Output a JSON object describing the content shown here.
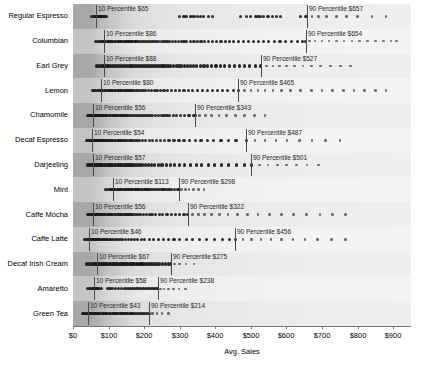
{
  "chart_data": {
    "type": "scatter",
    "title": "",
    "xlabel": "Avg. Sales",
    "ylabel": "",
    "xlim": [
      0,
      950
    ],
    "xticks": [
      0,
      100,
      200,
      300,
      400,
      500,
      600,
      700,
      800,
      900
    ],
    "xtick_labels": [
      "$0",
      "$100",
      "$200",
      "$300",
      "$400",
      "$500",
      "$600",
      "$700",
      "$800",
      "$900"
    ],
    "grid": false,
    "legend": "none",
    "categories": [
      "Regular Espresso",
      "Columbian",
      "Earl Grey",
      "Lemon",
      "Chamomile",
      "Decaf Espresso",
      "Darjeeling",
      "Mint",
      "Caffe Mocha",
      "Caffe Latte",
      "Decaf Irish Cream",
      "Amaretto",
      "Green Tea"
    ],
    "series": [
      {
        "name": "Regular Espresso",
        "p10": 65,
        "p90": 657,
        "p10_label": "10 Percentile $65",
        "p90_label": "90 Percentile $657",
        "points": [
          52,
          58,
          61,
          63,
          64,
          65,
          66,
          67,
          68,
          70,
          71,
          73,
          74,
          76,
          78,
          80,
          83,
          86,
          90,
          94,
          300,
          312,
          318,
          330,
          336,
          342,
          350,
          358,
          366,
          380,
          392,
          470,
          488,
          500,
          512,
          520,
          528,
          536,
          548,
          560,
          572,
          584,
          640,
          655,
          672,
          690,
          712,
          740,
          768,
          800,
          840,
          880
        ]
      },
      {
        "name": "Columbian",
        "p10": 86,
        "p90": 654,
        "p10_label": "10 Percentile $86",
        "p90_label": "90 Percentile $654",
        "points": [
          64,
          70,
          76,
          80,
          84,
          86,
          88,
          92,
          96,
          100,
          104,
          108,
          112,
          116,
          120,
          124,
          128,
          132,
          136,
          140,
          144,
          148,
          152,
          156,
          160,
          164,
          168,
          172,
          176,
          180,
          186,
          192,
          198,
          204,
          210,
          216,
          222,
          228,
          234,
          240,
          248,
          256,
          264,
          272,
          280,
          288,
          296,
          304,
          312,
          320,
          330,
          340,
          350,
          360,
          370,
          380,
          392,
          404,
          416,
          428,
          440,
          452,
          466,
          480,
          494,
          508,
          522,
          536,
          550,
          566,
          582,
          598,
          614,
          630,
          646,
          654,
          664,
          680,
          700,
          720,
          740,
          762,
          784,
          806,
          828,
          850,
          872,
          894,
          910
        ]
      },
      {
        "name": "Earl Grey",
        "p10": 88,
        "p90": 527,
        "p10_label": "10 Percentile $88",
        "p90_label": "90 Percentile $527",
        "points": [
          66,
          72,
          78,
          82,
          86,
          88,
          92,
          96,
          100,
          106,
          112,
          118,
          124,
          130,
          136,
          142,
          148,
          154,
          160,
          166,
          172,
          178,
          184,
          190,
          196,
          202,
          208,
          214,
          220,
          226,
          232,
          238,
          244,
          250,
          256,
          262,
          268,
          274,
          282,
          290,
          298,
          306,
          314,
          322,
          330,
          338,
          348,
          358,
          368,
          378,
          390,
          402,
          414,
          426,
          440,
          454,
          468,
          482,
          496,
          512,
          527,
          544,
          562,
          580,
          600,
          622,
          646,
          670,
          696,
          724,
          752,
          780
        ]
      },
      {
        "name": "Lemon",
        "p10": 80,
        "p90": 465,
        "p10_label": "10 Percentile $80",
        "p90_label": "90 Percentile $465",
        "points": [
          56,
          62,
          68,
          72,
          76,
          80,
          84,
          88,
          92,
          96,
          100,
          104,
          108,
          112,
          116,
          120,
          124,
          128,
          132,
          136,
          140,
          144,
          148,
          152,
          156,
          160,
          164,
          168,
          174,
          180,
          186,
          192,
          198,
          204,
          212,
          220,
          228,
          236,
          246,
          256,
          266,
          276,
          288,
          300,
          312,
          324,
          336,
          350,
          364,
          378,
          392,
          406,
          420,
          434,
          450,
          465,
          482,
          500,
          520,
          540,
          562,
          586,
          612,
          640,
          670,
          700,
          730,
          760,
          790,
          820,
          850,
          880
        ]
      },
      {
        "name": "Chamomile",
        "p10": 56,
        "p90": 343,
        "p10_label": "10 Percentile $56",
        "p90_label": "90 Percentile $343",
        "points": [
          40,
          44,
          48,
          52,
          54,
          56,
          58,
          60,
          62,
          64,
          66,
          68,
          70,
          72,
          74,
          76,
          78,
          80,
          82,
          84,
          86,
          88,
          90,
          94,
          98,
          102,
          106,
          110,
          114,
          118,
          122,
          126,
          130,
          134,
          138,
          142,
          146,
          152,
          158,
          164,
          170,
          176,
          182,
          188,
          194,
          200,
          206,
          212,
          218,
          224,
          232,
          240,
          248,
          256,
          264,
          272,
          282,
          292,
          302,
          314,
          326,
          338,
          343,
          356,
          372,
          390,
          410,
          432,
          456,
          482,
          510,
          540
        ]
      },
      {
        "name": "Decaf Espresso",
        "p10": 54,
        "p90": 487,
        "p10_label": "10 Percentile $54",
        "p90_label": "90 Percentile $487",
        "points": [
          38,
          42,
          46,
          50,
          52,
          54,
          56,
          58,
          60,
          62,
          64,
          66,
          68,
          70,
          72,
          74,
          76,
          78,
          80,
          82,
          84,
          86,
          88,
          90,
          92,
          94,
          96,
          100,
          104,
          108,
          112,
          116,
          120,
          124,
          128,
          132,
          136,
          140,
          144,
          148,
          154,
          160,
          166,
          172,
          180,
          188,
          196,
          204,
          214,
          224,
          234,
          246,
          258,
          270,
          284,
          298,
          312,
          328,
          344,
          360,
          378,
          396,
          416,
          436,
          458,
          487,
          512,
          540,
          570,
          602,
          636,
          672,
          710,
          750
        ]
      },
      {
        "name": "Darjeeling",
        "p10": 57,
        "p90": 501,
        "p10_label": "10 Percentile $57",
        "p90_label": "90 Percentile $501",
        "points": [
          42,
          46,
          50,
          53,
          55,
          57,
          59,
          61,
          63,
          65,
          67,
          69,
          71,
          73,
          75,
          77,
          79,
          81,
          84,
          88,
          92,
          96,
          100,
          104,
          108,
          112,
          116,
          120,
          124,
          128,
          132,
          136,
          140,
          144,
          148,
          152,
          156,
          160,
          164,
          168,
          172,
          178,
          184,
          190,
          196,
          204,
          212,
          220,
          230,
          240,
          250,
          262,
          274,
          286,
          300,
          314,
          330,
          346,
          362,
          380,
          398,
          418,
          438,
          460,
          482,
          501,
          524,
          548,
          574,
          600,
          628,
          658,
          690
        ]
      },
      {
        "name": "Mint",
        "p10": 113,
        "p90": 298,
        "p10_label": "10 Percentile $113",
        "p90_label": "90 Percentile $298",
        "points": [
          92,
          98,
          104,
          108,
          112,
          113,
          116,
          120,
          124,
          128,
          132,
          136,
          140,
          144,
          148,
          152,
          156,
          160,
          164,
          168,
          172,
          176,
          180,
          184,
          188,
          192,
          196,
          200,
          204,
          208,
          212,
          216,
          220,
          226,
          232,
          238,
          244,
          250,
          256,
          262,
          270,
          278,
          286,
          294,
          298,
          306,
          316,
          326,
          338,
          352,
          368
        ]
      },
      {
        "name": "Caffe Mocha",
        "p10": 56,
        "p90": 322,
        "p10_label": "10 Percentile $56",
        "p90_label": "90 Percentile $322",
        "points": [
          40,
          44,
          48,
          52,
          54,
          56,
          58,
          60,
          62,
          64,
          66,
          68,
          70,
          72,
          74,
          76,
          78,
          80,
          82,
          84,
          86,
          88,
          92,
          96,
          100,
          104,
          108,
          112,
          116,
          120,
          124,
          128,
          132,
          136,
          140,
          144,
          148,
          152,
          156,
          160,
          166,
          172,
          178,
          184,
          190,
          198,
          206,
          214,
          222,
          232,
          242,
          252,
          264,
          276,
          288,
          300,
          312,
          322,
          336,
          352,
          370,
          390,
          412,
          436,
          462,
          490,
          520,
          552,
          586,
          620,
          656,
          694,
          730,
          766
        ]
      },
      {
        "name": "Caffe Latte",
        "p10": 46,
        "p90": 456,
        "p10_label": "10 Percentile $46",
        "p90_label": "90 Percentile $456",
        "points": [
          32,
          36,
          40,
          43,
          45,
          46,
          48,
          50,
          52,
          54,
          56,
          58,
          60,
          62,
          64,
          66,
          68,
          70,
          72,
          74,
          78,
          82,
          86,
          90,
          94,
          98,
          102,
          106,
          110,
          116,
          122,
          128,
          134,
          140,
          148,
          156,
          164,
          172,
          182,
          192,
          202,
          214,
          226,
          240,
          254,
          268,
          284,
          300,
          318,
          336,
          356,
          376,
          398,
          420,
          440,
          456,
          478,
          502,
          528,
          556,
          586,
          618,
          652,
          688,
          726,
          766
        ]
      },
      {
        "name": "Decaf Irish Cream",
        "p10": 67,
        "p90": 275,
        "p10_label": "10 Percentile $67",
        "p90_label": "90 Percentile $275",
        "points": [
          -46,
          -28,
          -12,
          38,
          44,
          50,
          56,
          60,
          64,
          67,
          70,
          73,
          76,
          79,
          82,
          85,
          88,
          91,
          94,
          98,
          102,
          106,
          110,
          114,
          118,
          122,
          126,
          130,
          134,
          138,
          142,
          146,
          150,
          154,
          158,
          162,
          166,
          170,
          174,
          178,
          182,
          186,
          190,
          194,
          198,
          204,
          210,
          216,
          222,
          228,
          236,
          244,
          252,
          260,
          268,
          275,
          286,
          300,
          318,
          340
        ]
      },
      {
        "name": "Amaretto",
        "p10": 58,
        "p90": 238,
        "p10_label": "10 Percentile $58",
        "p90_label": "90 Percentile $238",
        "points": [
          40,
          46,
          50,
          54,
          56,
          58,
          60,
          62,
          64,
          66,
          68,
          70,
          74,
          80,
          96,
          104,
          112,
          120,
          128,
          136,
          144,
          150,
          156,
          162,
          168,
          174,
          180,
          186,
          192,
          198,
          204,
          210,
          216,
          222,
          228,
          234,
          238,
          246,
          256,
          268,
          282,
          298,
          316
        ]
      },
      {
        "name": "Green Tea",
        "p10": 43,
        "p90": 214,
        "p10_label": "10 Percentile $43",
        "p90_label": "90 Percentile $214",
        "points": [
          28,
          32,
          36,
          40,
          42,
          43,
          45,
          47,
          49,
          51,
          53,
          55,
          57,
          59,
          61,
          63,
          65,
          67,
          69,
          71,
          74,
          78,
          82,
          86,
          90,
          94,
          98,
          102,
          106,
          110,
          114,
          118,
          122,
          126,
          130,
          134,
          138,
          142,
          146,
          150,
          154,
          158,
          162,
          166,
          170,
          176,
          182,
          188,
          194,
          200,
          208,
          214,
          224,
          236,
          250,
          268
        ]
      }
    ]
  }
}
